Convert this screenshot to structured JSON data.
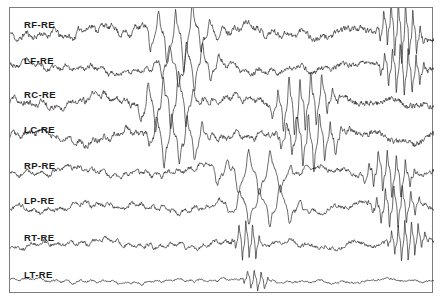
{
  "figure": {
    "kind": "eeg-strip-chart",
    "background_color": "#ffffff",
    "frame_color": "#7c7c83",
    "trace_color": "#1a1a1a",
    "label_color": "#1a1a1a"
  },
  "chart_data": {
    "type": "line",
    "title": "",
    "subtitle": "",
    "xlabel": "",
    "ylabel": "",
    "grid": false,
    "legend_position": "none",
    "axis_visible": false,
    "x": {
      "range": [
        0,
        1000
      ],
      "tick_labels": [],
      "units": "samples"
    },
    "channel_count": 8,
    "row_height": 35.1,
    "series": [
      {
        "name": "RF-RE",
        "label": "RF-RE",
        "baseline_y": 31,
        "amplitude": 9.5,
        "seed": 11,
        "spike_regions": [
          [
            0.3,
            0.5
          ],
          [
            0.86,
            0.98
          ]
        ],
        "values": []
      },
      {
        "name": "LF-RE",
        "label": "LF-RE",
        "baseline_y": 67,
        "amplitude": 7.5,
        "seed": 23,
        "spike_regions": [
          [
            0.33,
            0.52
          ],
          [
            0.86,
            0.99
          ]
        ],
        "values": []
      },
      {
        "name": "RC-RE",
        "label": "RC-RE",
        "baseline_y": 101,
        "amplitude": 9.0,
        "seed": 37,
        "spike_regions": [
          [
            0.28,
            0.46
          ],
          [
            0.6,
            0.78
          ]
        ],
        "values": []
      },
      {
        "name": "LC-RE",
        "label": "LC-RE",
        "baseline_y": 136,
        "amplitude": 8.5,
        "seed": 53,
        "spike_regions": [
          [
            0.3,
            0.48
          ],
          [
            0.62,
            0.8
          ]
        ],
        "values": []
      },
      {
        "name": "RP-RE",
        "label": "RP-RE",
        "baseline_y": 171,
        "amplitude": 7.0,
        "seed": 71,
        "spike_regions": [
          [
            0.45,
            0.7
          ],
          [
            0.82,
            0.97
          ]
        ],
        "values": []
      },
      {
        "name": "LP-RE",
        "label": "LP-RE",
        "baseline_y": 206,
        "amplitude": 6.5,
        "seed": 97,
        "spike_regions": [
          [
            0.48,
            0.72
          ],
          [
            0.84,
            0.98
          ]
        ],
        "values": []
      },
      {
        "name": "RT-RE",
        "label": "RT-RE",
        "baseline_y": 243,
        "amplitude": 6.0,
        "seed": 113,
        "spike_regions": [
          [
            0.52,
            0.6
          ],
          [
            0.88,
            0.99
          ]
        ],
        "values": []
      },
      {
        "name": "LT-RE",
        "label": "LT-RE",
        "baseline_y": 280,
        "amplitude": 3.2,
        "seed": 131,
        "spike_regions": [
          [
            0.54,
            0.62
          ]
        ],
        "values": []
      }
    ]
  },
  "labels": [
    {
      "text": "RF-RE",
      "x": 14,
      "y": 12
    },
    {
      "text": "LF-RE",
      "x": 14,
      "y": 48
    },
    {
      "text": "RC-RE",
      "x": 14,
      "y": 82
    },
    {
      "text": "LC-RE",
      "x": 14,
      "y": 117
    },
    {
      "text": "RP-RE",
      "x": 14,
      "y": 153
    },
    {
      "text": "LP-RE",
      "x": 14,
      "y": 188
    },
    {
      "text": "RT-RE",
      "x": 14,
      "y": 225
    },
    {
      "text": "LT-RE",
      "x": 14,
      "y": 262
    }
  ]
}
